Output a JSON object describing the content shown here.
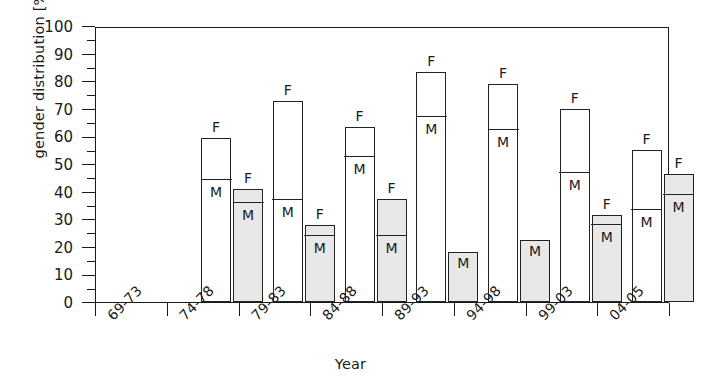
{
  "chart_data": {
    "type": "bar",
    "title": "",
    "xlabel": "Year",
    "ylabel": "gender distribution [%]",
    "ylim": [
      0,
      100
    ],
    "ytick_step": 10,
    "yminor_step": 5,
    "grid": false,
    "legend": "none",
    "categories": [
      "69-73",
      "74-78",
      "79-83",
      "84-88",
      "89-93",
      "94-98",
      "99-03",
      "04-05"
    ],
    "ytick_labels": [
      "0",
      "10",
      "20",
      "30",
      "40",
      "50",
      "60",
      "70",
      "80",
      "90",
      "100"
    ],
    "segment_labels": {
      "male": "M",
      "female": "F"
    },
    "groups": [
      {
        "category": "69-73",
        "bars": [
          {
            "style": "white",
            "total": 59.5,
            "male": 44.0,
            "female": 15.5,
            "male_label": "M",
            "female_label": "F"
          },
          {
            "style": "gray",
            "total": 41.0,
            "male": 35.5,
            "female": 5.5,
            "male_label": "M",
            "female_label": "F"
          }
        ]
      },
      {
        "category": "74-78",
        "bars": [
          {
            "style": "white",
            "total": 73.0,
            "male": 36.5,
            "female": 36.5,
            "male_label": "M",
            "female_label": "F"
          },
          {
            "style": "gray",
            "total": 28.0,
            "male": 23.5,
            "female": 4.5,
            "male_label": "M",
            "female_label": "F"
          }
        ]
      },
      {
        "category": "79-83",
        "bars": [
          {
            "style": "white",
            "total": 63.5,
            "male": 52.0,
            "female": 11.5,
            "male_label": "M",
            "female_label": "F"
          },
          {
            "style": "gray",
            "total": 37.5,
            "male": 23.5,
            "female": 14.0,
            "male_label": "M",
            "female_label": "F"
          }
        ]
      },
      {
        "category": "84-88",
        "bars": [
          {
            "style": "white",
            "total": 83.5,
            "male": 66.5,
            "female": 17.0,
            "male_label": "M",
            "female_label": "F"
          },
          {
            "style": "gray",
            "total": 18.0,
            "male": 18.0,
            "female": 0,
            "male_label": "M",
            "female_label": ""
          }
        ]
      },
      {
        "category": "89-93",
        "bars": [
          {
            "style": "white",
            "total": 79.0,
            "male": 62.0,
            "female": 17.0,
            "male_label": "M",
            "female_label": "F"
          },
          {
            "style": "gray",
            "total": 22.5,
            "male": 22.5,
            "female": 0,
            "male_label": "M",
            "female_label": ""
          }
        ]
      },
      {
        "category": "94-98",
        "bars": [
          {
            "style": "white",
            "total": 70.0,
            "male": 46.5,
            "female": 23.5,
            "male_label": "M",
            "female_label": "F"
          },
          {
            "style": "gray",
            "total": 31.5,
            "male": 27.5,
            "female": 4.0,
            "male_label": "M",
            "female_label": "F"
          }
        ]
      },
      {
        "category": "99-03",
        "bars": [
          {
            "style": "white",
            "total": 55.0,
            "male": 33.0,
            "female": 22.0,
            "male_label": "M",
            "female_label": "F"
          },
          {
            "style": "gray",
            "total": 46.5,
            "male": 38.5,
            "female": 8.0,
            "male_label": "M",
            "female_label": "F"
          }
        ]
      },
      {
        "category": "04-05",
        "bars": [
          {
            "style": "white",
            "total": 45.0,
            "male": 29.5,
            "female": 15.5,
            "male_label": "M",
            "female_label": "F"
          },
          {
            "style": "gray",
            "total": 57.0,
            "male": 44.0,
            "female": 13.0,
            "male_label": "M",
            "female_label": "F"
          }
        ]
      }
    ]
  },
  "colors": {
    "axis": "#1a1a1a",
    "bar_white": "#ffffff",
    "bar_gray": "#e8e8e8",
    "bar_outline": "#222222"
  }
}
